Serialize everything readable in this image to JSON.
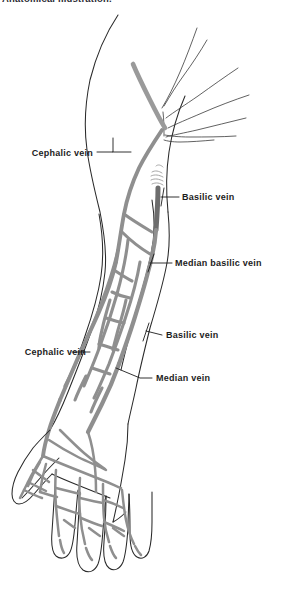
{
  "page": {
    "width": 281,
    "height": 590,
    "background_color": "#ffffff"
  },
  "caption": {
    "top_text": "Anatomical illustration."
  },
  "figure": {
    "view": "anterior view of right arm, forearm and dorsum of hand",
    "colors": {
      "vein_gray": "#8f8f8f",
      "vein_dark": "#6e6e6e",
      "outline": "#2a2a2a",
      "label_text": "#1c1c1c",
      "leader_line": "#1c1c1c",
      "background": "#ffffff"
    }
  },
  "labels": [
    {
      "id": "cephalic-vein-upper",
      "text": "Cephalic vein",
      "side": "left",
      "text_x": 20,
      "text_y": 148,
      "leader": {
        "x1": 96,
        "y1": 152,
        "x2": 130,
        "y2": 152,
        "elbow_x": 113,
        "elbow_y": 140
      }
    },
    {
      "id": "basilic-vein-upper",
      "text": "Basilic vein",
      "side": "right",
      "text_x": 182,
      "text_y": 193,
      "leader": {
        "x1": 178,
        "y1": 197,
        "x2": 156,
        "y2": 197
      }
    },
    {
      "id": "median-basilic-vein",
      "text": "Median basilic vein",
      "side": "right",
      "text_x": 175,
      "text_y": 259,
      "leader": {
        "x1": 171,
        "y1": 263,
        "x2": 148,
        "y2": 263
      }
    },
    {
      "id": "basilic-vein-lower",
      "text": "Basilic vein",
      "side": "right",
      "text_x": 165,
      "text_y": 331,
      "leader": {
        "x1": 161,
        "y1": 335,
        "x2": 144,
        "y2": 331
      }
    },
    {
      "id": "cephalic-vein-lower",
      "text": "Cephalic vein",
      "side": "left",
      "text_x": 13,
      "text_y": 348,
      "leader": {
        "x1": 89,
        "y1": 352,
        "x2": 70,
        "y2": 352
      }
    },
    {
      "id": "median-vein",
      "text": "Median vein",
      "side": "right",
      "text_x": 155,
      "text_y": 374,
      "leader": {
        "x1": 151,
        "y1": 378,
        "x2": 116,
        "y2": 373
      }
    }
  ]
}
